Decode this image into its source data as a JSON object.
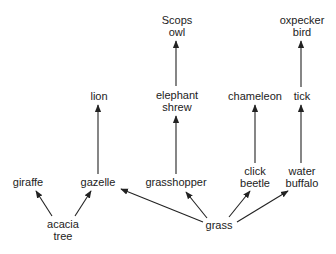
{
  "diagram": {
    "type": "food-web",
    "colors": {
      "text": "#222222",
      "arrow": "#222222",
      "background": "#ffffff"
    },
    "nodes": [
      {
        "id": "scops_owl",
        "lines": [
          "Scops",
          "owl"
        ],
        "x": 177,
        "y": 26
      },
      {
        "id": "oxpecker_bird",
        "lines": [
          "oxpecker",
          "bird"
        ],
        "x": 302,
        "y": 26
      },
      {
        "id": "lion",
        "lines": [
          "lion"
        ],
        "x": 99,
        "y": 96
      },
      {
        "id": "elephant_shrew",
        "lines": [
          "elephant",
          "shrew"
        ],
        "x": 177,
        "y": 102
      },
      {
        "id": "chameleon",
        "lines": [
          "chameleon"
        ],
        "x": 255,
        "y": 96
      },
      {
        "id": "tick",
        "lines": [
          "tick"
        ],
        "x": 302,
        "y": 96
      },
      {
        "id": "giraffe",
        "lines": [
          "giraffe"
        ],
        "x": 28,
        "y": 182
      },
      {
        "id": "gazelle",
        "lines": [
          "gazelle"
        ],
        "x": 98,
        "y": 182
      },
      {
        "id": "grasshopper",
        "lines": [
          "grasshopper"
        ],
        "x": 176,
        "y": 182
      },
      {
        "id": "click_beetle",
        "lines": [
          "click",
          "beetle"
        ],
        "x": 255,
        "y": 177
      },
      {
        "id": "water_buffalo",
        "lines": [
          "water",
          "buffalo"
        ],
        "x": 302,
        "y": 177
      },
      {
        "id": "acacia_tree",
        "lines": [
          "acacia",
          "tree"
        ],
        "x": 63,
        "y": 230
      },
      {
        "id": "grass",
        "lines": [
          "grass"
        ],
        "x": 219,
        "y": 225
      }
    ],
    "edges": [
      {
        "from": "acacia_tree",
        "to": "giraffe"
      },
      {
        "from": "acacia_tree",
        "to": "gazelle"
      },
      {
        "from": "grass",
        "to": "gazelle"
      },
      {
        "from": "grass",
        "to": "grasshopper"
      },
      {
        "from": "grass",
        "to": "click_beetle"
      },
      {
        "from": "grass",
        "to": "water_buffalo"
      },
      {
        "from": "gazelle",
        "to": "lion"
      },
      {
        "from": "grasshopper",
        "to": "elephant_shrew"
      },
      {
        "from": "elephant_shrew",
        "to": "scops_owl"
      },
      {
        "from": "click_beetle",
        "to": "chameleon"
      },
      {
        "from": "water_buffalo",
        "to": "tick"
      },
      {
        "from": "tick",
        "to": "oxpecker_bird"
      }
    ]
  }
}
